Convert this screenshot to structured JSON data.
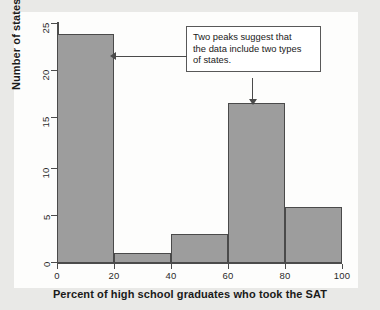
{
  "chart_data": {
    "type": "bar",
    "title": "",
    "xlabel": "Percent of high school graduates who took the SAT",
    "ylabel": "Number of states",
    "categories": [
      "0-20",
      "20-40",
      "40-60",
      "60-80",
      "80-100"
    ],
    "bin_edges": [
      0,
      20,
      40,
      60,
      80,
      100
    ],
    "values": [
      24,
      1,
      3,
      17,
      6
    ],
    "xlim": [
      0,
      100
    ],
    "ylim": [
      0,
      25
    ],
    "x_ticks": [
      "0",
      "20",
      "40",
      "60",
      "80",
      "100"
    ],
    "y_ticks": [
      "0",
      "5",
      "10",
      "15",
      "20",
      "25"
    ],
    "grid": false,
    "legend": null,
    "bar_color": "#9d9d9d",
    "bar_border_color": "#4a4a4a",
    "axis_color": "#4c4c4c",
    "annotations": [
      {
        "text": "Two peaks suggest that the data include two types of states.",
        "line1": "Two peaks suggest that",
        "line2": "the data include two types",
        "line3": "of states.",
        "points_to": [
          "0-20",
          "60-80"
        ]
      }
    ]
  },
  "axes": {
    "y_title": "Number of states",
    "x_title": "Percent of high school graduates who took the SAT",
    "y_ticks": [
      {
        "label": "25",
        "top": 23
      },
      {
        "label": "20",
        "top": 70
      },
      {
        "label": "15",
        "top": 117
      },
      {
        "label": "10",
        "top": 168
      },
      {
        "label": "5",
        "top": 215
      },
      {
        "label": "0",
        "top": 262
      }
    ],
    "x_ticks": [
      {
        "label": "0",
        "left": 57
      },
      {
        "label": "20",
        "left": 114
      },
      {
        "label": "40",
        "left": 171
      },
      {
        "label": "60",
        "left": 228
      },
      {
        "label": "80",
        "left": 285
      },
      {
        "label": "100",
        "left": 342
      }
    ]
  },
  "bars": [
    {
      "name": "bar-0-20",
      "left": 57,
      "width": 57,
      "top": 34,
      "height": 229,
      "value": 24
    },
    {
      "name": "bar-20-40",
      "left": 114,
      "width": 57,
      "top": 253,
      "height": 10,
      "value": 1
    },
    {
      "name": "bar-40-60",
      "left": 171,
      "width": 57,
      "top": 234,
      "height": 29,
      "value": 3
    },
    {
      "name": "bar-60-80",
      "left": 228,
      "width": 57,
      "top": 103,
      "height": 160,
      "value": 17
    },
    {
      "name": "bar-80-100",
      "left": 285,
      "width": 57,
      "top": 207,
      "height": 56,
      "value": 6
    }
  ],
  "callout": {
    "line1": "Two peaks suggest that",
    "line2": "the data include two types",
    "line3": "of states."
  }
}
